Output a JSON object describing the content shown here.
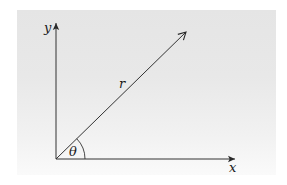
{
  "figure": {
    "background": {
      "top_color": "#e5e5e5",
      "bottom_color": "#fafafa"
    },
    "stroke_color": "#333333",
    "labels": {
      "y_axis": "y",
      "x_axis": "x",
      "vector": "r",
      "angle": "θ"
    },
    "geometry": {
      "origin": [
        56,
        159
      ],
      "y_axis_end": [
        56,
        22
      ],
      "x_axis_end": [
        236,
        159
      ],
      "vector_end": [
        187,
        31
      ],
      "angle_arc_radius": 29
    }
  }
}
